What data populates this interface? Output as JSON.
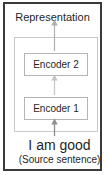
{
  "diagram": {
    "title": "Representation",
    "output_label": "Representation",
    "encoders": [
      {
        "label": "Encoder 2",
        "name": "encoder-2"
      },
      {
        "label": "Encoder 1",
        "name": "encoder-1"
      }
    ],
    "source": {
      "sentence": "I am good",
      "caption": "(Source sentence)"
    },
    "arrows": [
      {
        "name": "arrow-encoder2-to-representation",
        "from": "Encoder 2",
        "to": "Representation",
        "color": "#b0b0b0"
      },
      {
        "name": "arrow-encoder1-to-encoder2",
        "from": "Encoder 1",
        "to": "Encoder 2",
        "color": "#c0c0c0"
      },
      {
        "name": "arrow-source-to-encoder1",
        "from": "I am good",
        "to": "Encoder 1",
        "color": "#8f8f8f"
      }
    ],
    "colors": {
      "outer_border": "#3a3a3a",
      "inner_border": "#c9c9c9",
      "box_border": "#b5b5b5",
      "text": "#1f1f1f",
      "background": "#ffffff"
    }
  }
}
